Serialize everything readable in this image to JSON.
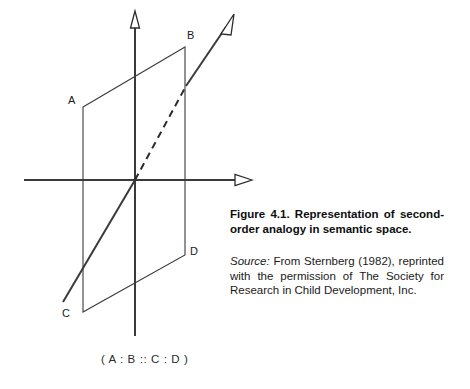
{
  "figure": {
    "axes": [
      {
        "name": "vertical-axis",
        "label": ""
      },
      {
        "name": "horizontal-axis",
        "label": ""
      },
      {
        "name": "diagonal-axis",
        "label": ""
      }
    ],
    "vertex_labels": [
      {
        "id": "A",
        "text": "A",
        "x": 68,
        "y": 104
      },
      {
        "id": "B",
        "text": "B",
        "x": 187,
        "y": 39
      },
      {
        "id": "C",
        "text": "C",
        "x": 62,
        "y": 317
      },
      {
        "id": "D",
        "text": "D",
        "x": 190,
        "y": 255
      }
    ],
    "formula": "( A : B :: C : D )",
    "stroke_color": "#333333",
    "background_color": "#ffffff"
  },
  "caption": {
    "title": "Figure 4.1. Representation of second-order analogy in semantic space.",
    "source_word": "Source:",
    "source_text": " From Sternberg (1982), reprinted with the permission of The Society for Research in Child Development, Inc."
  }
}
